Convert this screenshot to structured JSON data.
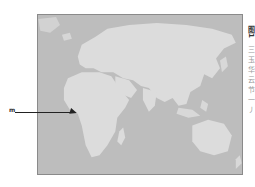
{
  "figure": {
    "type": "world map (Eastern Hemisphere focus)",
    "colors": {
      "ocean": "#bdbdbd",
      "land": "#dcdcdc",
      "frame": "#8a8a8a",
      "pointer": "#222222"
    }
  },
  "pointer": {
    "label": "m",
    "target": "Gulf of Guinea / West-Central Africa"
  },
  "caption": {
    "title": "图1",
    "body": "三玉华云节一丿"
  }
}
